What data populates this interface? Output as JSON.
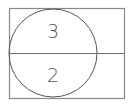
{
  "diagram": {
    "type": "sector-circle-in-rectangle",
    "frame": {
      "x": 9,
      "y": 8,
      "width": 116,
      "height": 91,
      "stroke": "#808080"
    },
    "divider": {
      "y": 53,
      "x1": 9,
      "x2": 125,
      "stroke": "#6e6e6e"
    },
    "circle": {
      "cx": 53,
      "cy": 53,
      "r": 44,
      "stroke": "#555555"
    },
    "labels": {
      "top": "3",
      "bottom": "2"
    }
  }
}
